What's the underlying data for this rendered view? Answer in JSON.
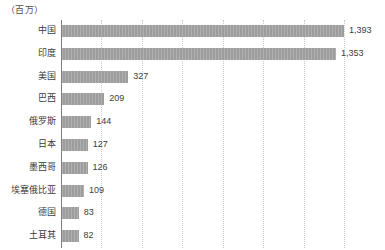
{
  "chart_data": {
    "type": "bar",
    "orientation": "horizontal",
    "title": "（百万）",
    "subtitle": "",
    "xlabel": "",
    "ylabel": "",
    "unit_caption": "（百万）",
    "grid": true,
    "gridlines_values": [
      200,
      400,
      600,
      800,
      1000,
      1200,
      1400
    ],
    "xlim": [
      0,
      1500
    ],
    "legend": null,
    "bar_color": "#9d9d9d",
    "axis_color": "#7f7f7f",
    "gridline_color": "#c9c9c9",
    "label_color": "#3d3d3d",
    "categories": [
      "中国",
      "印度",
      "美国",
      "巴西",
      "俄罗斯",
      "日本",
      "墨西哥",
      "埃塞俄比亚",
      "德国",
      "土耳其"
    ],
    "values": [
      1393,
      1353,
      327,
      209,
      144,
      127,
      126,
      109,
      83,
      82
    ],
    "value_labels": [
      "1,393",
      "1,353",
      "327",
      "209",
      "144",
      "127",
      "126",
      "109",
      "83",
      "82"
    ],
    "rows": [
      {
        "category": "中国",
        "value": 1393,
        "value_label": "1,393"
      },
      {
        "category": "印度",
        "value": 1353,
        "value_label": "1,353"
      },
      {
        "category": "美国",
        "value": 327,
        "value_label": "327"
      },
      {
        "category": "巴西",
        "value": 209,
        "value_label": "209"
      },
      {
        "category": "俄罗斯",
        "value": 144,
        "value_label": "144"
      },
      {
        "category": "日本",
        "value": 127,
        "value_label": "127"
      },
      {
        "category": "墨西哥",
        "value": 126,
        "value_label": "126"
      },
      {
        "category": "埃塞俄比亚",
        "value": 109,
        "value_label": "109"
      },
      {
        "category": "德国",
        "value": 83,
        "value_label": "83"
      },
      {
        "category": "土耳其",
        "value": 82,
        "value_label": "82"
      }
    ]
  }
}
